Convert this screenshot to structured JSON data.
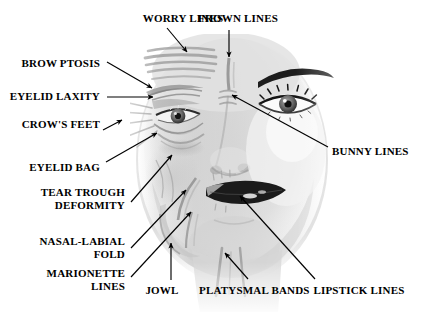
{
  "figure": {
    "background_color": "#ffffff",
    "text_color": "#000000",
    "arrow_color": "#000000",
    "width": 422,
    "height": 317
  },
  "annotations": [
    {
      "id": "worry-lines",
      "label": "WORRY LINES",
      "label_lines": [
        "WORRY LINES"
      ],
      "align": "center",
      "label_x": 140,
      "label_y": 12,
      "label_w": 86,
      "arrow": {
        "x1": 167,
        "y1": 28,
        "x2": 187,
        "y2": 52
      },
      "target": "forehead horizontal wrinkle bands"
    },
    {
      "id": "frown-lines",
      "label": "FROWN LINES",
      "label_lines": [
        "FROWN LINES"
      ],
      "align": "center",
      "label_x": 192,
      "label_y": 12,
      "label_w": 92,
      "arrow": {
        "x1": 229,
        "y1": 30,
        "x2": 229,
        "y2": 57
      },
      "target": "glabella vertical line between brows"
    },
    {
      "id": "brow-ptosis",
      "label": "BROW PTOSIS",
      "label_lines": [
        "BROW PTOSIS"
      ],
      "align": "right",
      "label_x": 8,
      "label_y": 57,
      "label_w": 92,
      "arrow": {
        "x1": 107,
        "y1": 62,
        "x2": 152,
        "y2": 88
      },
      "target": "drooping eyebrow"
    },
    {
      "id": "eyelid-laxity",
      "label": "EYELID LAXITY",
      "label_lines": [
        "EYELID LAXITY"
      ],
      "align": "right",
      "label_x": 8,
      "label_y": 90,
      "label_w": 92,
      "arrow": {
        "x1": 107,
        "y1": 97,
        "x2": 153,
        "y2": 97
      },
      "target": "upper eyelid skin laxity"
    },
    {
      "id": "crows-feet",
      "label": "CROW'S FEET",
      "label_lines": [
        "CROW'S FEET"
      ],
      "align": "right",
      "label_x": 8,
      "label_y": 118,
      "label_w": 92,
      "arrow": {
        "x1": 103,
        "y1": 130,
        "x2": 122,
        "y2": 120
      },
      "target": "lateral canthal rhytids"
    },
    {
      "id": "eyelid-bag",
      "label": "EYELID BAG",
      "label_lines": [
        "EYELID BAG"
      ],
      "align": "right",
      "label_x": 18,
      "label_y": 161,
      "label_w": 82,
      "arrow": {
        "x1": 106,
        "y1": 162,
        "x2": 157,
        "y2": 133
      },
      "target": "lower lid fat bag"
    },
    {
      "id": "tear-trough-deformity",
      "label": "TEAR TROUGH DEFORMITY",
      "label_lines": [
        "TEAR TROUGH",
        "DEFORMITY"
      ],
      "align": "right",
      "label_x": 18,
      "label_y": 186,
      "label_w": 107,
      "arrow": {
        "x1": 131,
        "y1": 202,
        "x2": 172,
        "y2": 155
      },
      "target": "infraorbital hollow"
    },
    {
      "id": "nasal-labial-fold",
      "label": "NASAL-LABIAL FOLD",
      "label_lines": [
        "NASAL-LABIAL",
        "FOLD"
      ],
      "align": "right",
      "label_x": 18,
      "label_y": 235,
      "label_w": 107,
      "arrow": {
        "x1": 131,
        "y1": 248,
        "x2": 186,
        "y2": 190
      },
      "target": "nasolabial crease"
    },
    {
      "id": "marionette-lines",
      "label": "MARIONETTE LINES",
      "label_lines": [
        "MARIONETTE",
        "LINES"
      ],
      "align": "right",
      "label_x": 18,
      "label_y": 267,
      "label_w": 107,
      "arrow": {
        "x1": 131,
        "y1": 277,
        "x2": 191,
        "y2": 212
      },
      "target": "oral commissure downturn lines"
    },
    {
      "id": "bunny-lines",
      "label": "BUNNY LINES",
      "label_lines": [
        "BUNNY LINES"
      ],
      "align": "left",
      "label_x": 332,
      "label_y": 145,
      "label_w": 88,
      "arrow": {
        "x1": 328,
        "y1": 147,
        "x2": 232,
        "y2": 95
      },
      "target": "nasal dorsum transverse lines"
    },
    {
      "id": "jowl",
      "label": "JOWL",
      "label_lines": [
        "JOWL"
      ],
      "align": "center",
      "label_x": 142,
      "label_y": 284,
      "label_w": 40,
      "arrow": {
        "x1": 171,
        "y1": 280,
        "x2": 171,
        "y2": 243
      },
      "target": "jawline sagging"
    },
    {
      "id": "platysmal-bands",
      "label": "PLATYSMAL BANDS",
      "label_lines": [
        "PLATYSMAL BANDS"
      ],
      "align": "center",
      "label_x": 199,
      "label_y": 284,
      "label_w": 104,
      "arrow": {
        "x1": 248,
        "y1": 279,
        "x2": 225,
        "y2": 253
      },
      "target": "vertical neck cords"
    },
    {
      "id": "lipstick-lines",
      "label": "LIPSTICK LINES",
      "label_lines": [
        "LIPSTICK LINES"
      ],
      "align": "center",
      "label_x": 312,
      "label_y": 284,
      "label_w": 94,
      "arrow": {
        "x1": 315,
        "y1": 279,
        "x2": 240,
        "y2": 196
      },
      "target": "perioral vertical rhytids"
    }
  ]
}
